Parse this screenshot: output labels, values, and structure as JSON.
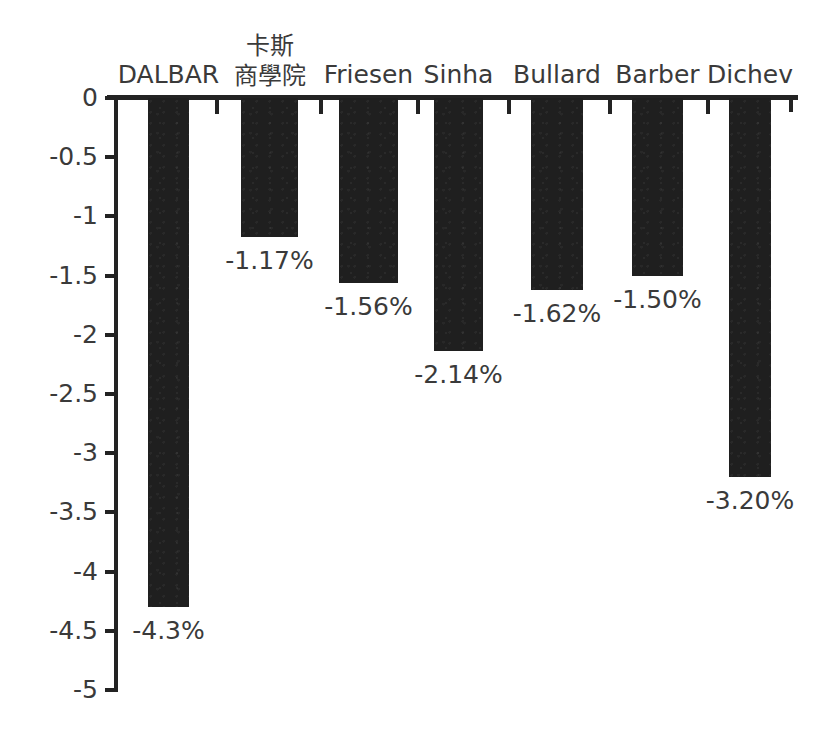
{
  "chart_data": {
    "type": "bar",
    "title": "",
    "subtitle": "",
    "xlabel": "",
    "ylabel": "",
    "categories": [
      "DALBAR",
      "卡斯\n商學院",
      "Friesen",
      "Sinha",
      "Bullard",
      "Barber",
      "Dichev"
    ],
    "values": [
      -4.3,
      -1.17,
      -1.56,
      -2.14,
      -1.62,
      -1.5,
      -3.2
    ],
    "data_labels": [
      "-4.3%",
      "-1.17%",
      "-1.56%",
      "-2.14%",
      "-1.62%",
      "-1.50%",
      "-3.20%"
    ],
    "ylim": [
      -5,
      0
    ],
    "ytick_values": [
      0,
      -0.5,
      -1,
      -1.5,
      -2,
      -2.5,
      -3,
      -3.5,
      -4,
      -4.5,
      -5
    ],
    "ytick_labels": [
      "0",
      "-0.5",
      "-1",
      "-1.5",
      "-2",
      "-2.5",
      "-3",
      "-3.5",
      "-4",
      "-4.5",
      "-5"
    ],
    "grid": false,
    "legend": false,
    "legend_position": "none",
    "bar_color": "#1f1f1f",
    "axis_color": "#232323",
    "text_color": "#3a3a3a",
    "background_color": "#ffffff",
    "orientation": "vertical",
    "bars": [
      {
        "label": "DALBAR",
        "label_lines": [
          "DALBAR"
        ],
        "value": -4.3,
        "data_label": "-4.3%",
        "x": 148,
        "width": 41,
        "label_y": 60
      },
      {
        "label": "卡斯商學院",
        "label_lines": [
          "卡斯",
          "商學院"
        ],
        "value": -1.17,
        "data_label": "-1.17%",
        "x": 241,
        "width": 57,
        "label_y": 31
      },
      {
        "label": "Friesen",
        "label_lines": [
          "Friesen"
        ],
        "value": -1.56,
        "data_label": "-1.56%",
        "x": 339,
        "width": 59,
        "label_y": 60
      },
      {
        "label": "Sinha",
        "label_lines": [
          "Sinha"
        ],
        "value": -2.14,
        "data_label": "-2.14%",
        "x": 434,
        "width": 49,
        "label_y": 60
      },
      {
        "label": "Bullard",
        "label_lines": [
          "Bullard"
        ],
        "value": -1.62,
        "data_label": "-1.62%",
        "x": 531,
        "width": 52,
        "label_y": 60
      },
      {
        "label": "Barber",
        "label_lines": [
          "Barber"
        ],
        "value": -1.5,
        "data_label": "-1.50%",
        "x": 632,
        "width": 51,
        "label_y": 60
      },
      {
        "label": "Dichev",
        "label_lines": [
          "Dichev"
        ],
        "value": -3.2,
        "data_label": "-3.20%",
        "x": 729,
        "width": 42,
        "label_y": 60
      }
    ]
  }
}
